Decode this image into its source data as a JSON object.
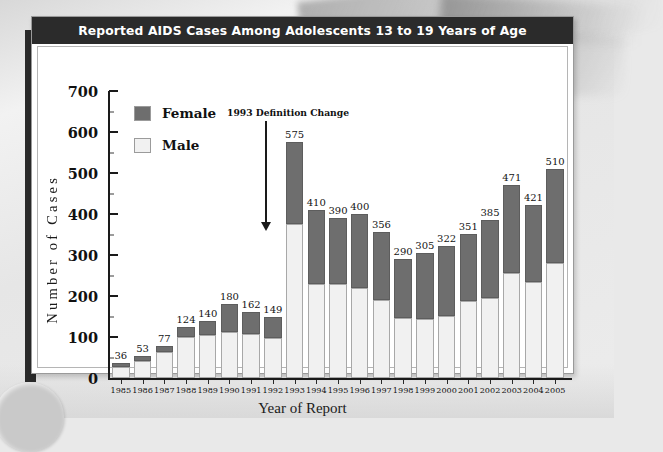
{
  "chart_title": "Reported AIDS Cases Among Adolescents 13 to 19 Years of Age",
  "legend": {
    "items": [
      {
        "label": "Female",
        "color": "#6e6e6e"
      },
      {
        "label": "Male",
        "color": "#f1f1f1"
      }
    ]
  },
  "annotation": {
    "text": "1993 Definition Change"
  },
  "axes": {
    "ylabel": "Number of Cases",
    "xlabel": "Year of Report",
    "yticks": [
      "0",
      "100",
      "200",
      "300",
      "400",
      "500",
      "600",
      "700"
    ]
  },
  "chart_data": {
    "type": "bar",
    "title": "Reported AIDS Cases Among Adolescents 13 to 19 Years of Age",
    "subtitle": "",
    "xlabel": "Year of Report",
    "ylabel": "Number of Cases",
    "ylim": [
      0,
      700
    ],
    "ytick_step": 100,
    "grid": false,
    "stacked": true,
    "legend_position": "upper-left",
    "annotations": [
      {
        "text": "1993 Definition Change",
        "points_to": "1993",
        "style": "down-arrow"
      }
    ],
    "categories": [
      "1985",
      "1986",
      "1987",
      "1988",
      "1989",
      "1990",
      "1991",
      "1992",
      "1993",
      "1994",
      "1995",
      "1996",
      "1997",
      "1998",
      "1999",
      "2000",
      "2001",
      "2002",
      "2003",
      "2004",
      "2005"
    ],
    "totals": [
      36,
      53,
      77,
      124,
      140,
      180,
      162,
      149,
      575,
      410,
      390,
      400,
      356,
      290,
      305,
      322,
      351,
      385,
      471,
      421,
      510
    ],
    "series": [
      {
        "name": "Male",
        "color": "#f1f1f1",
        "values": [
          28,
          42,
          63,
          100,
          106,
          112,
          108,
          98,
          375,
          230,
          230,
          220,
          190,
          147,
          144,
          150,
          188,
          196,
          257,
          235,
          280
        ]
      },
      {
        "name": "Female",
        "color": "#6e6e6e",
        "values": [
          8,
          11,
          14,
          24,
          34,
          68,
          54,
          51,
          200,
          180,
          160,
          180,
          166,
          143,
          161,
          172,
          163,
          189,
          214,
          186,
          230
        ]
      }
    ],
    "data_labels": [
      "36",
      "53",
      "77",
      "124",
      "140",
      "180",
      "162",
      "149",
      "575",
      "410",
      "390",
      "400",
      "356",
      "290",
      "305",
      "322",
      "351",
      "385",
      "471",
      "421",
      "510"
    ]
  }
}
